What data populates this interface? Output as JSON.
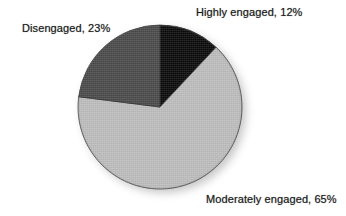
{
  "chart_data": {
    "type": "pie",
    "title": "",
    "subtitle": "",
    "xlabel": "",
    "ylabel": "",
    "legend_position": "none",
    "grid": false,
    "labels_inline": true,
    "start_angle_deg": 0,
    "direction": "clockwise",
    "categories": [
      "Highly engaged",
      "Moderately engaged",
      "Disengaged"
    ],
    "values": [
      12,
      65,
      23
    ],
    "value_unit": "%",
    "colors": [
      "#0a0a0a",
      "#bdbdbd",
      "#4a4a4a"
    ],
    "slices": [
      {
        "name": "Highly engaged",
        "value": 12,
        "display": "Highly engaged, 12%",
        "color": "#0a0a0a",
        "start_deg": 0,
        "end_deg": 43.2,
        "label_position": "top-right"
      },
      {
        "name": "Moderately engaged",
        "value": 65,
        "display": "Moderately engaged, 65%",
        "color": "#bdbdbd",
        "start_deg": 43.2,
        "end_deg": 277.2,
        "label_position": "bottom-right"
      },
      {
        "name": "Disengaged",
        "value": 23,
        "display": "Disengaged, 23%",
        "color": "#4a4a4a",
        "start_deg": 277.2,
        "end_deg": 360,
        "label_position": "top-left"
      }
    ]
  },
  "labels": {
    "highly_engaged": "Highly engaged, 12%",
    "disengaged": "Disengaged, 23%",
    "moderately_engaged": "Moderately engaged, 65%"
  },
  "style": {
    "background": "#ffffff",
    "text_color": "#1d1d1d",
    "outline_color": "#2a2a2a",
    "shadow_color": "#9a9a9a"
  }
}
